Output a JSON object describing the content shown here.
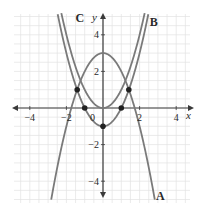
{
  "chart_data": {
    "type": "line",
    "title": "",
    "xlabel": "x",
    "ylabel": "y",
    "xlim": [
      -5.5,
      5
    ],
    "ylim": [
      -5.2,
      5.3
    ],
    "grid": true,
    "grid_step": 0.5,
    "x_ticks": [
      {
        "value": -4,
        "label": "−4"
      },
      {
        "value": -2,
        "label": "−2"
      },
      {
        "value": 2,
        "label": "2"
      },
      {
        "value": 4,
        "label": "4"
      }
    ],
    "y_ticks": [
      {
        "value": 4,
        "label": "4"
      },
      {
        "value": 2,
        "label": "2"
      },
      {
        "value": -2,
        "label": "−2"
      },
      {
        "value": -4,
        "label": "−4"
      }
    ],
    "origin_label": "0",
    "series": [
      {
        "name": "A",
        "equation": "y = 3 - x^2",
        "vertex": [
          0,
          3
        ],
        "x_range": [
          -2.83,
          2.83
        ],
        "label_pos": [
          2.9,
          -5
        ]
      },
      {
        "name": "B",
        "equation": "y = x^2",
        "vertex": [
          0,
          0
        ],
        "x_range": [
          -2.3,
          2.3
        ],
        "label_pos": [
          2.55,
          4.5
        ]
      },
      {
        "name": "C",
        "equation": "y = x^2 - 1",
        "vertex": [
          0,
          -1
        ],
        "x_range": [
          -2.5,
          2.5
        ],
        "label_pos": [
          -1.5,
          4.7
        ]
      }
    ],
    "points": [
      {
        "x": -1.41,
        "y": 1
      },
      {
        "x": 1.41,
        "y": 1
      },
      {
        "x": -1,
        "y": 0
      },
      {
        "x": 1,
        "y": 0
      },
      {
        "x": 0,
        "y": -1
      }
    ],
    "colors": {
      "curve": "#7a7a7a",
      "axis": "#3a3a3a",
      "grid": "#e3e3e3",
      "point": "#222222",
      "text": "#2a2a2a"
    }
  }
}
